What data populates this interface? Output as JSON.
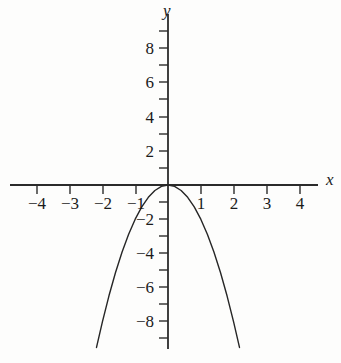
{
  "chart_data": {
    "type": "line",
    "title": "",
    "subtitle": "",
    "xlabel": "x",
    "ylabel": "y",
    "xlim": [
      -4.7,
      4.7
    ],
    "ylim": [
      -9.6,
      9.3
    ],
    "grid": false,
    "legend": false,
    "legend_position": "none",
    "axis_style": "cartesian-cross",
    "tick_interval": 1,
    "label_interval": 2,
    "x_tick_values": [
      -4,
      -3,
      -2,
      -1,
      1,
      2,
      3,
      4
    ],
    "x_tick_labels": [
      "−4",
      "−3",
      "−2",
      "−1",
      "1",
      "2",
      "3",
      "4"
    ],
    "x_minor_ticks": [
      -4.5,
      -3.5,
      -2.5,
      -1.5,
      -0.5,
      0.5,
      1.5,
      2.5,
      3.5,
      4.5
    ],
    "y_tick_values": [
      8,
      6,
      4,
      2,
      -2,
      -4,
      -6,
      -8
    ],
    "y_tick_labels": [
      "8",
      "6",
      "4",
      "2",
      "−2",
      "−4",
      "−6",
      "−8"
    ],
    "y_minor_ticks": [
      9,
      7,
      5,
      3,
      1,
      -1,
      -3,
      -5,
      -7,
      -9
    ],
    "series": [
      {
        "name": "y = -2x^2",
        "equation": "y = −2x²",
        "color": "#262626",
        "linewidth": 1.4,
        "vertex": [
          0,
          0
        ],
        "opens": "down",
        "x": [
          -2.18,
          -2.0,
          -1.8,
          -1.6,
          -1.4,
          -1.2,
          -1.0,
          -0.8,
          -0.6,
          -0.4,
          -0.2,
          0.0,
          0.2,
          0.4,
          0.6,
          0.8,
          1.0,
          1.2,
          1.4,
          1.6,
          1.8,
          2.0,
          2.18
        ],
        "values": [
          -9.5,
          -8.0,
          -6.48,
          -5.12,
          -3.92,
          -2.88,
          -2.0,
          -1.28,
          -0.72,
          -0.32,
          -0.08,
          0.0,
          -0.08,
          -0.32,
          -0.72,
          -1.28,
          -2.0,
          -2.88,
          -3.92,
          -5.12,
          -6.48,
          -8.0,
          -9.5
        ]
      }
    ],
    "colors": {
      "axis": "#2b2b2b",
      "curve": "#262626",
      "text": "#1b1b1b",
      "background": "#fdfdfc"
    }
  }
}
